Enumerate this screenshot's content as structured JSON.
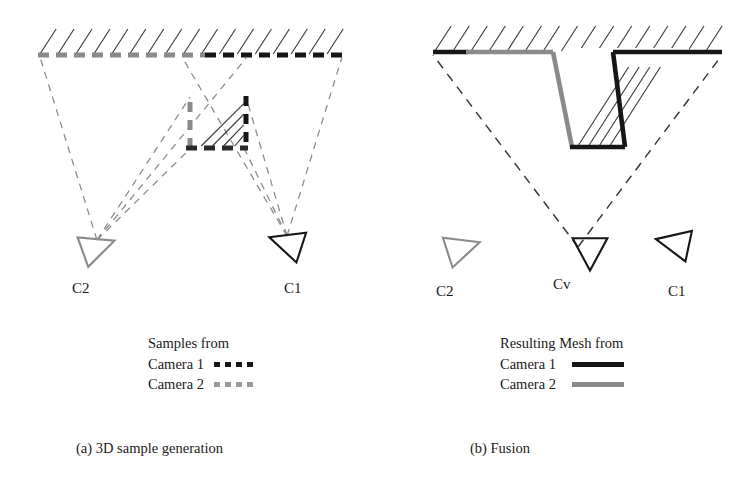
{
  "figure": {
    "width": 753,
    "height": 489,
    "background": "#ffffff"
  },
  "colors": {
    "black": "#161616",
    "gray": "#8a8a8a",
    "dash_gray": "#8d8d8d",
    "hatch": "#3c3c3c",
    "text": "#1a1a1a"
  },
  "panel_a": {
    "caption": "(a) 3D sample generation",
    "caption_x": 76,
    "caption_y": 440,
    "surface": {
      "line_y": 55,
      "x_start": 38,
      "x_end": 343,
      "hatch_count": 17,
      "hatch_len": 26,
      "hatch_dx": 13,
      "note": "ground surface with hatching above, sample dashes along it"
    },
    "samples_gray": {
      "x_start": 38,
      "x_end": 205,
      "y": 55,
      "color": "#8a8a8a",
      "dash": "11 7",
      "width": 5
    },
    "samples_black": {
      "x_start": 205,
      "x_end": 343,
      "y": 55,
      "color": "#161616",
      "dash": "11 7",
      "width": 5
    },
    "notch": {
      "apex_x": 246,
      "apex_y": 94,
      "left_x": 190,
      "bottom_y": 148,
      "right_x": 246,
      "hatch_count": 4,
      "left_wall_color": "#8a8a8a",
      "right_wall_color": "#161616",
      "bottom_color": "#2a2a2a"
    },
    "cameras": [
      {
        "id": "C2",
        "label": "C2",
        "label_x": 72,
        "label_y": 280,
        "cx": 97,
        "cy": 247,
        "size": 30,
        "direction": "right",
        "rotation": -20,
        "color": "#8a8a8a"
      },
      {
        "id": "C1",
        "label": "C1",
        "label_x": 284,
        "label_y": 280,
        "cx": 287,
        "cy": 243,
        "size": 30,
        "direction": "left",
        "rotation": 18,
        "color": "#161616"
      }
    ],
    "rays": [
      {
        "x1": 97,
        "y1": 240,
        "x2": 40,
        "y2": 57,
        "color": "#8d8d8d"
      },
      {
        "x1": 97,
        "y1": 240,
        "x2": 190,
        "y2": 97,
        "color": "#8d8d8d"
      },
      {
        "x1": 97,
        "y1": 240,
        "x2": 193,
        "y2": 146,
        "color": "#8d8d8d"
      },
      {
        "x1": 97,
        "y1": 240,
        "x2": 247,
        "y2": 57,
        "color": "#8d8d8d"
      },
      {
        "x1": 287,
        "y1": 236,
        "x2": 342,
        "y2": 57,
        "color": "#8d8d8d"
      },
      {
        "x1": 287,
        "y1": 236,
        "x2": 246,
        "y2": 97,
        "color": "#8d8d8d"
      },
      {
        "x1": 287,
        "y1": 236,
        "x2": 243,
        "y2": 146,
        "color": "#8d8d8d"
      },
      {
        "x1": 287,
        "y1": 236,
        "x2": 182,
        "y2": 57,
        "color": "#8d8d8d"
      }
    ],
    "legend": {
      "x": 148,
      "y": 333,
      "title": "Samples from",
      "rows": [
        {
          "label": "Camera 1",
          "style": "dashed",
          "color": "#161616"
        },
        {
          "label": "Camera 2",
          "style": "dashed",
          "color": "#9a9a9a"
        }
      ]
    }
  },
  "panel_b": {
    "caption": "(b) Fusion",
    "caption_x": 470,
    "caption_y": 440,
    "surface": {
      "line_y": 52,
      "x_start": 433,
      "x_end": 722,
      "hatch_count": 16,
      "hatch_len": 26,
      "hatch_dx": 13
    },
    "mesh": {
      "left_black": {
        "x1": 433,
        "y1": 52,
        "x2": 468,
        "y2": 52,
        "color": "#161616"
      },
      "left_gray": {
        "x1": 466,
        "y1": 52,
        "x2": 553,
        "y2": 52,
        "color": "#8a8a8a"
      },
      "left_wall": {
        "x1": 553,
        "y1": 52,
        "x2": 572,
        "y2": 147,
        "color": "#8a8a8a"
      },
      "bottom": {
        "x1": 570,
        "y1": 147,
        "x2": 625,
        "y2": 147,
        "color": "#161616"
      },
      "right_wall": {
        "x1": 625,
        "y1": 147,
        "x2": 613,
        "y2": 52,
        "color": "#161616"
      },
      "right_top": {
        "x1": 613,
        "y1": 52,
        "x2": 722,
        "y2": 52,
        "color": "#161616"
      },
      "groove_hatch_count": 4
    },
    "rays": [
      {
        "x1": 578,
        "y1": 247,
        "x2": 433,
        "y2": 55,
        "color": "#3a3a3a"
      },
      {
        "x1": 578,
        "y1": 247,
        "x2": 722,
        "y2": 55,
        "color": "#3a3a3a"
      }
    ],
    "cameras": [
      {
        "id": "C2",
        "label": "C2",
        "label_x": 436,
        "label_y": 283,
        "cx": 462,
        "cy": 248,
        "size": 30,
        "direction": "right",
        "rotation": -18,
        "color": "#8a8a8a"
      },
      {
        "id": "Cv",
        "label": "Cv",
        "label_x": 553,
        "label_y": 276,
        "cx": 590,
        "cy": 252,
        "size": 30,
        "direction": "down",
        "rotation": 0,
        "color": "#161616"
      },
      {
        "id": "C1",
        "label": "C1",
        "label_x": 668,
        "label_y": 283,
        "cx": 674,
        "cy": 243,
        "size": 30,
        "direction": "left",
        "rotation": 12,
        "color": "#161616"
      }
    ],
    "legend": {
      "x": 500,
      "y": 333,
      "title": "Resulting Mesh from",
      "rows": [
        {
          "label": "Camera 1",
          "style": "solid",
          "color": "#161616"
        },
        {
          "label": "Camera 2",
          "style": "solid",
          "color": "#8a8a8a"
        }
      ]
    }
  }
}
